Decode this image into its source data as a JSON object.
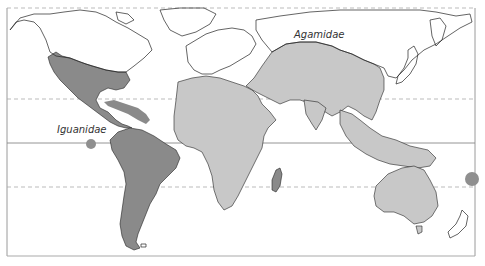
{
  "map": {
    "type": "world distribution map",
    "projection": "equirectangular-style world outline",
    "legend_labels": [
      {
        "id": "agamidae",
        "label": "Agamidae",
        "color": "#c8c8c8",
        "regions": [
          "Africa",
          "Southern Eurasia",
          "Middle East",
          "South Asia",
          "Southeast Asia",
          "Australia",
          "New Guinea"
        ]
      },
      {
        "id": "iguanidae",
        "label": "Iguanidae",
        "color": "#8a8a8a",
        "regions": [
          "North America (southern)",
          "Central America",
          "Caribbean",
          "South America",
          "Madagascar",
          "Galapagos",
          "Fiji/Tonga"
        ]
      }
    ],
    "reference_lines": [
      {
        "name": "arctic-edge",
        "style": "dashed"
      },
      {
        "name": "tropic-of-cancer",
        "style": "dashed"
      },
      {
        "name": "equator",
        "style": "solid"
      },
      {
        "name": "tropic-of-capricorn",
        "style": "dashed"
      }
    ],
    "colors": {
      "land_outline": "#222222",
      "unshaded_land": "#ffffff",
      "agamidae_fill": "#c8c8c8",
      "iguanidae_fill": "#8a8a8a",
      "grid_line": "#999999",
      "frame": "#9a9a9a"
    }
  }
}
